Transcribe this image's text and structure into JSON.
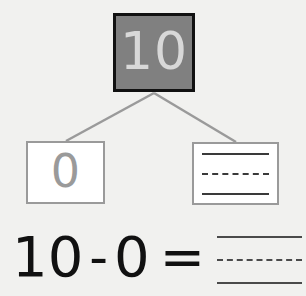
{
  "worksheet": {
    "title": "Number bond subtraction worksheet",
    "background_color": "#f1f1ef"
  },
  "number_bond": {
    "total_box": {
      "value": "10",
      "fill_color": "#808080",
      "border_color": "#111111",
      "text_color": "#d8d8d8"
    },
    "part_left_box": {
      "value": "0",
      "fill_color": "#ffffff",
      "border_color": "#9a9a9a",
      "text_color": "#9a9a9a"
    },
    "part_right_box": {
      "value": "",
      "fill_color": "#ffffff",
      "border_color": "#9a9a9a",
      "lines": [
        "solid",
        "dashed",
        "solid"
      ]
    },
    "connector_color": "#9a9a9a"
  },
  "equation": {
    "minuend": "10",
    "operator": "-",
    "subtrahend": "0",
    "equals": "=",
    "answer": "",
    "answer_lines": [
      "solid",
      "dashed",
      "solid"
    ],
    "text_color": "#111111"
  }
}
